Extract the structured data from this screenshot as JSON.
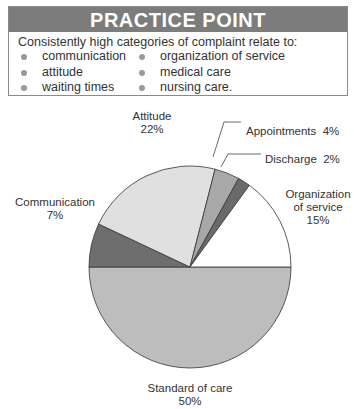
{
  "practice_point": {
    "title": "PRACTICE POINT",
    "intro": "Consistently high categories of complaint relate to:",
    "left_items": [
      "communication",
      "attitude",
      "waiting times"
    ],
    "right_items": [
      "organization of service",
      "medical care",
      "nursing care."
    ]
  },
  "chart_data": {
    "type": "pie",
    "title": "",
    "categories": [
      "Standard of care",
      "Communication",
      "Attitude",
      "Appointments",
      "Discharge",
      "Organization of service"
    ],
    "values": [
      50,
      7,
      22,
      4,
      2,
      15
    ],
    "unit": "%",
    "colors": [
      "#bdbdbd",
      "#6e6e6e",
      "#e0e0e0",
      "#a8a8a8",
      "#6a6a6a",
      "#ffffff"
    ],
    "labels": {
      "standard": {
        "name": "Standard of care",
        "pct": "50%"
      },
      "communication": {
        "name": "Communication",
        "pct": "7%"
      },
      "attitude": {
        "name": "Attitude",
        "pct": "22%"
      },
      "appointments": {
        "text": "Appointments  4%"
      },
      "discharge": {
        "text": "Discharge  2%"
      },
      "organization": {
        "line1": "Organization",
        "line2": "of service",
        "pct": "15%"
      }
    }
  }
}
